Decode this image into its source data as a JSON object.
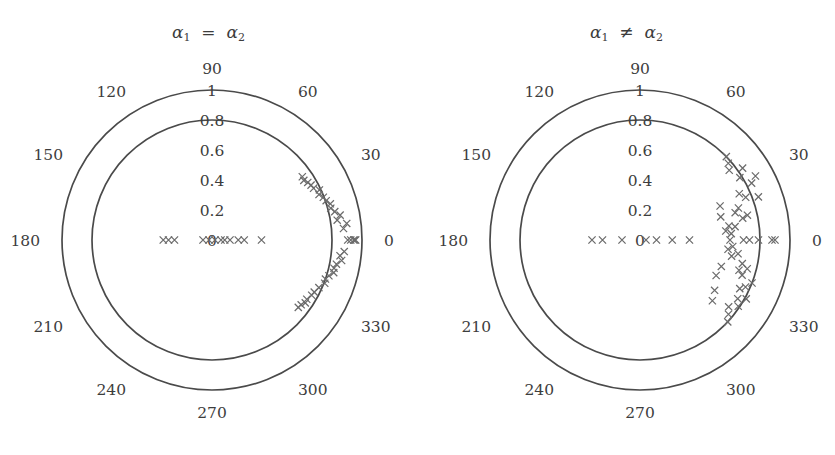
{
  "figure": {
    "width": 835,
    "height": 455,
    "background": "#ffffff",
    "stroke_color": "#4a4a4a",
    "marker_color": "#6b6b6b",
    "text_color": "#3d3d3d"
  },
  "panels": [
    {
      "id": "left",
      "title": "α₁ = α₂",
      "title_alpha": "α",
      "title_sub1": "1",
      "title_rel": "=",
      "title_sub2": "2",
      "center": {
        "x": 212,
        "y": 240
      },
      "r_unit": 150,
      "angle_ticks": [
        "0",
        "30",
        "60",
        "90",
        "120",
        "150",
        "180",
        "210",
        "240",
        "270",
        "300",
        "330"
      ],
      "radial_ticks": [
        "0",
        "0.2",
        "0.4",
        "0.6",
        "0.8",
        "1"
      ],
      "grid_circles": [
        0.8,
        1
      ]
    },
    {
      "id": "right",
      "title": "α₁ ≠ α₂",
      "title_alpha": "α",
      "title_sub1": "1",
      "title_rel": "≠",
      "title_sub2": "2",
      "center": {
        "x": 222,
        "y": 240
      },
      "r_unit": 150,
      "angle_ticks": [
        "0",
        "30",
        "60",
        "90",
        "120",
        "150",
        "180",
        "210",
        "240",
        "270",
        "300",
        "330"
      ],
      "radial_ticks": [
        "0",
        "0.2",
        "0.4",
        "0.6",
        "0.8",
        "1"
      ],
      "grid_circles": [
        0.8,
        1
      ]
    }
  ],
  "chart_data": [
    {
      "type": "scatter",
      "subplot": "left",
      "title": "α₁ = α₂",
      "coordinate_system": "polar",
      "xlabel": "",
      "ylabel": "",
      "rlim": [
        0,
        1
      ],
      "rticks": [
        0,
        0.2,
        0.4,
        0.6,
        0.8,
        1
      ],
      "thetaticks": [
        0,
        30,
        60,
        90,
        120,
        150,
        180,
        210,
        240,
        270,
        300,
        330
      ],
      "grid": true,
      "grid_circles_at_r": [
        0.8,
        1.0
      ],
      "legend": null,
      "marker": "x",
      "points": [
        {
          "theta": 0,
          "r": 0.905
        },
        {
          "theta": 0,
          "r": 0.925
        },
        {
          "theta": 0,
          "r": 0.945
        },
        {
          "theta": 0,
          "r": 0.952
        },
        {
          "theta": 0,
          "r": 0.958
        },
        {
          "theta": 0,
          "r": 0.02
        },
        {
          "theta": 0,
          "r": 0.06
        },
        {
          "theta": 0,
          "r": 0.085
        },
        {
          "theta": 0,
          "r": 0.12
        },
        {
          "theta": 0,
          "r": 0.175
        },
        {
          "theta": 0,
          "r": 0.215
        },
        {
          "theta": 0,
          "r": 0.33
        },
        {
          "theta": 180,
          "r": 0.02
        },
        {
          "theta": 180,
          "r": 0.06
        },
        {
          "theta": 180,
          "r": 0.25
        },
        {
          "theta": 180,
          "r": 0.29
        },
        {
          "theta": 180,
          "r": 0.325
        },
        {
          "theta": 5,
          "r": 0.88
        },
        {
          "theta": 7,
          "r": 0.905
        },
        {
          "theta": 9,
          "r": 0.845
        },
        {
          "theta": 11,
          "r": 0.87
        },
        {
          "theta": 13,
          "r": 0.84
        },
        {
          "theta": 15,
          "r": 0.82
        },
        {
          "theta": 17,
          "r": 0.825
        },
        {
          "theta": 19,
          "r": 0.805
        },
        {
          "theta": 21,
          "r": 0.795
        },
        {
          "theta": 23,
          "r": 0.775
        },
        {
          "theta": 25,
          "r": 0.79
        },
        {
          "theta": 27,
          "r": 0.76
        },
        {
          "theta": 29,
          "r": 0.755
        },
        {
          "theta": 31,
          "r": 0.745
        },
        {
          "theta": 33,
          "r": 0.73
        },
        {
          "theta": 35,
          "r": 0.735
        },
        {
          "theta": -5,
          "r": 0.885
        },
        {
          "theta": -7,
          "r": 0.86
        },
        {
          "theta": -9,
          "r": 0.875
        },
        {
          "theta": -11,
          "r": 0.845
        },
        {
          "theta": -13,
          "r": 0.835
        },
        {
          "theta": -15,
          "r": 0.84
        },
        {
          "theta": -17,
          "r": 0.815
        },
        {
          "theta": -19,
          "r": 0.8
        },
        {
          "theta": -21,
          "r": 0.805
        },
        {
          "theta": -24,
          "r": 0.78
        },
        {
          "theta": -27,
          "r": 0.765
        },
        {
          "theta": -29,
          "r": 0.76
        },
        {
          "theta": -32,
          "r": 0.745
        },
        {
          "theta": -34,
          "r": 0.75
        },
        {
          "theta": -36,
          "r": 0.735
        },
        {
          "theta": -38,
          "r": 0.73
        }
      ]
    },
    {
      "type": "scatter",
      "subplot": "right",
      "title": "α₁ ≠ α₂",
      "coordinate_system": "polar",
      "xlabel": "",
      "ylabel": "",
      "rlim": [
        0,
        1
      ],
      "rticks": [
        0,
        0.2,
        0.4,
        0.6,
        0.8,
        1
      ],
      "thetaticks": [
        0,
        30,
        60,
        90,
        120,
        150,
        180,
        210,
        240,
        270,
        300,
        330
      ],
      "grid": true,
      "grid_circles_at_r": [
        0.8,
        1.0
      ],
      "legend": null,
      "marker": "x",
      "points": [
        {
          "theta": 0,
          "r": 0.04
        },
        {
          "theta": 0,
          "r": 0.11
        },
        {
          "theta": 0,
          "r": 0.215
        },
        {
          "theta": 0,
          "r": 0.33
        },
        {
          "theta": 0,
          "r": 0.6
        },
        {
          "theta": 0,
          "r": 0.69
        },
        {
          "theta": 0,
          "r": 0.73
        },
        {
          "theta": 0,
          "r": 0.79
        },
        {
          "theta": 0,
          "r": 0.88
        },
        {
          "theta": 0,
          "r": 0.9
        },
        {
          "theta": 180,
          "r": 0.12
        },
        {
          "theta": 180,
          "r": 0.25
        },
        {
          "theta": 180,
          "r": 0.32
        },
        {
          "theta": 4,
          "r": 0.61
        },
        {
          "theta": 6,
          "r": 0.575
        },
        {
          "theta": 8,
          "r": 0.64
        },
        {
          "theta": 9,
          "r": 0.6
        },
        {
          "theta": 12,
          "r": 0.7
        },
        {
          "theta": 13,
          "r": 0.735
        },
        {
          "theta": 16,
          "r": 0.66
        },
        {
          "theta": 18,
          "r": 0.69
        },
        {
          "theta": 20,
          "r": 0.84
        },
        {
          "theta": 22,
          "r": 0.76
        },
        {
          "theta": 25,
          "r": 0.73
        },
        {
          "theta": 27,
          "r": 0.835
        },
        {
          "theta": 29,
          "r": 0.88
        },
        {
          "theta": 32,
          "r": 0.785
        },
        {
          "theta": 35,
          "r": 0.835
        },
        {
          "theta": 38,
          "r": 0.755
        },
        {
          "theta": 41,
          "r": 0.78
        },
        {
          "theta": 44,
          "r": 0.8
        },
        {
          "theta": 16,
          "r": 0.56
        },
        {
          "theta": 23,
          "r": 0.58
        },
        {
          "theta": -4,
          "r": 0.62
        },
        {
          "theta": -6,
          "r": 0.59
        },
        {
          "theta": -8,
          "r": 0.66
        },
        {
          "theta": -10,
          "r": 0.62
        },
        {
          "theta": -13,
          "r": 0.7
        },
        {
          "theta": -15,
          "r": 0.74
        },
        {
          "theta": -17,
          "r": 0.69
        },
        {
          "theta": -19,
          "r": 0.72
        },
        {
          "theta": -21,
          "r": 0.8
        },
        {
          "theta": -24,
          "r": 0.77
        },
        {
          "theta": -26,
          "r": 0.74
        },
        {
          "theta": -29,
          "r": 0.81
        },
        {
          "theta": -31,
          "r": 0.76
        },
        {
          "theta": -34,
          "r": 0.79
        },
        {
          "theta": -37,
          "r": 0.74
        },
        {
          "theta": -40,
          "r": 0.77
        },
        {
          "theta": -43,
          "r": 0.8
        },
        {
          "theta": -18,
          "r": 0.57
        },
        {
          "theta": -25,
          "r": 0.56
        },
        {
          "theta": -34,
          "r": 0.6
        },
        {
          "theta": -40,
          "r": 0.63
        }
      ]
    }
  ]
}
